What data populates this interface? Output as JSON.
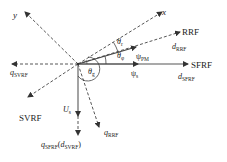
{
  "diagram": {
    "type": "vector-frame-diagram",
    "axes": {
      "x": "x",
      "y": "y"
    },
    "frames": {
      "rrf": {
        "name": "RRF",
        "d_axis": "d",
        "d_sub": "RRF",
        "q_axis": "q",
        "q_sub": "RRF"
      },
      "sfrf": {
        "name": "SFRF",
        "d_axis": "d",
        "d_sub": "SFRF",
        "q_axis": "q",
        "q_sub": "SFRF"
      },
      "svrf": {
        "name": "SVRF",
        "q_axis": "q",
        "q_sub": "SVRF",
        "d_axis": "d",
        "d_sub": "SVRF"
      }
    },
    "vectors": {
      "psi_pm": {
        "symbol": "ψ",
        "sub": "PM"
      },
      "psi_s": {
        "symbol": "ψ",
        "sub": "s"
      },
      "u_s": {
        "symbol": "U",
        "sub": "s"
      }
    },
    "angles": {
      "theta_r": {
        "symbol": "θ",
        "sub": "r"
      },
      "theta_phi": {
        "symbol": "θ",
        "sub": "φ"
      },
      "theta_g": {
        "symbol": "θ",
        "sub": "g"
      }
    },
    "compound_label": {
      "q": "q",
      "q_sub": "SFRF",
      "open": "(",
      "d": "d",
      "d_sub": "SVRF",
      "close": ")"
    }
  }
}
